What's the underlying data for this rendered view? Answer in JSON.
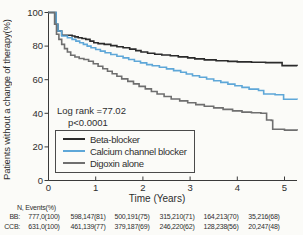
{
  "chart_data": {
    "type": "line",
    "variant": "kaplan-meier-step-curves",
    "title": "",
    "xlabel": "Time (Years)",
    "ylabel": "Patients without a change of therapy(%)",
    "xlim": [
      0,
      5.27
    ],
    "ylim": [
      0,
      100
    ],
    "xticks": [
      0,
      1,
      2,
      3,
      4,
      5
    ],
    "yticks": [
      0,
      20,
      40,
      60,
      80,
      100
    ],
    "grid": false,
    "legend_position": "inside-lower-left",
    "annotations": {
      "line1": "Log rank =77.02",
      "line2": "p<0.0001"
    },
    "series": [
      {
        "name": "Beta-blocker",
        "color": "#2b2b2b",
        "points": [
          [
            0,
            100
          ],
          [
            0.13,
            100
          ],
          [
            0.16,
            93
          ],
          [
            0.2,
            89
          ],
          [
            0.28,
            86.5
          ],
          [
            0.5,
            86
          ],
          [
            0.56,
            85.5
          ],
          [
            0.63,
            85
          ],
          [
            0.71,
            84.5
          ],
          [
            0.79,
            84
          ],
          [
            0.88,
            83
          ],
          [
            0.96,
            82
          ],
          [
            1.05,
            81.5
          ],
          [
            1.18,
            81
          ],
          [
            1.32,
            80.3
          ],
          [
            1.45,
            79.6
          ],
          [
            1.58,
            79
          ],
          [
            1.72,
            78.2
          ],
          [
            1.85,
            77.3
          ],
          [
            1.96,
            76.5
          ],
          [
            2.1,
            75.7
          ],
          [
            2.25,
            75.2
          ],
          [
            2.4,
            74.7
          ],
          [
            2.58,
            74.2
          ],
          [
            2.75,
            73.6
          ],
          [
            2.95,
            73
          ],
          [
            3.1,
            72.4
          ],
          [
            3.3,
            71.8
          ],
          [
            3.55,
            71.3
          ],
          [
            3.8,
            70.9
          ],
          [
            4.0,
            70.6
          ],
          [
            4.3,
            70.4
          ],
          [
            4.6,
            70.2
          ],
          [
            4.95,
            68.4
          ],
          [
            5.27,
            68.3
          ]
        ]
      },
      {
        "name": "Calcium channel blocker",
        "color": "#5ea7d8",
        "points": [
          [
            0,
            100
          ],
          [
            0.13,
            100
          ],
          [
            0.16,
            93
          ],
          [
            0.2,
            89
          ],
          [
            0.28,
            86
          ],
          [
            0.4,
            85
          ],
          [
            0.5,
            84
          ],
          [
            0.58,
            83
          ],
          [
            0.66,
            82
          ],
          [
            0.74,
            81
          ],
          [
            0.82,
            80
          ],
          [
            0.9,
            79
          ],
          [
            1.0,
            78
          ],
          [
            1.1,
            77
          ],
          [
            1.2,
            76
          ],
          [
            1.32,
            75
          ],
          [
            1.45,
            74
          ],
          [
            1.58,
            73
          ],
          [
            1.7,
            72
          ],
          [
            1.82,
            71
          ],
          [
            1.95,
            70
          ],
          [
            2.08,
            69
          ],
          [
            2.2,
            68.3
          ],
          [
            2.35,
            67.4
          ],
          [
            2.5,
            66.4
          ],
          [
            2.65,
            65.4
          ],
          [
            2.8,
            64.4
          ],
          [
            2.92,
            63.4
          ],
          [
            3.05,
            62.4
          ],
          [
            3.2,
            61.4
          ],
          [
            3.35,
            60.4
          ],
          [
            3.5,
            59.4
          ],
          [
            3.65,
            58.4
          ],
          [
            3.8,
            57.4
          ],
          [
            3.95,
            56.4
          ],
          [
            4.1,
            55.4
          ],
          [
            4.25,
            54.4
          ],
          [
            4.45,
            53.6
          ],
          [
            4.56,
            51.5
          ],
          [
            4.8,
            51
          ],
          [
            4.98,
            48.4
          ],
          [
            5.27,
            48.2
          ]
        ]
      },
      {
        "name": "Digoxin alone",
        "color": "#6f6f6f",
        "points": [
          [
            0,
            100
          ],
          [
            0.1,
            100
          ],
          [
            0.13,
            93
          ],
          [
            0.17,
            87
          ],
          [
            0.22,
            84
          ],
          [
            0.28,
            81
          ],
          [
            0.34,
            78.5
          ],
          [
            0.4,
            76.5
          ],
          [
            0.47,
            74.5
          ],
          [
            0.56,
            73.5
          ],
          [
            0.65,
            72.6
          ],
          [
            0.75,
            72
          ],
          [
            0.85,
            71
          ],
          [
            0.95,
            69.5
          ],
          [
            1.05,
            68
          ],
          [
            1.15,
            66.5
          ],
          [
            1.25,
            65
          ],
          [
            1.35,
            63.5
          ],
          [
            1.45,
            62
          ],
          [
            1.55,
            60.5
          ],
          [
            1.68,
            59
          ],
          [
            1.8,
            57.5
          ],
          [
            1.92,
            56
          ],
          [
            2.05,
            54.5
          ],
          [
            2.18,
            53
          ],
          [
            2.3,
            51.5
          ],
          [
            2.45,
            50
          ],
          [
            2.6,
            48.5
          ],
          [
            2.78,
            47.4
          ],
          [
            2.95,
            46.3
          ],
          [
            3.12,
            45.2
          ],
          [
            3.3,
            44.2
          ],
          [
            3.5,
            43.2
          ],
          [
            3.7,
            42.3
          ],
          [
            3.9,
            41.4
          ],
          [
            4.1,
            40.7
          ],
          [
            4.3,
            40.3
          ],
          [
            4.5,
            40
          ],
          [
            4.62,
            36
          ],
          [
            4.72,
            35.8
          ],
          [
            4.75,
            30.5
          ],
          [
            5.0,
            30
          ],
          [
            5.27,
            29.8
          ]
        ]
      }
    ]
  },
  "risk_table": {
    "header": "N, Events(%)",
    "rows": [
      {
        "label": "BB:",
        "values": [
          "777,0(100)",
          "598,147(81)",
          "500,191(75)",
          "315,210(71)",
          "164,213(70)",
          "35,216(68)"
        ]
      },
      {
        "label": "CCB:",
        "values": [
          "631,0(100)",
          "461,139(77)",
          "379,187(69)",
          "246,220(62)",
          "128,238(56)",
          "20,247(48)"
        ]
      }
    ]
  },
  "colors": {
    "axis": "#3a3a3a",
    "text": "#2e2e2e",
    "background": "#fbfbf8",
    "legend_border": "#4a4a4a"
  }
}
